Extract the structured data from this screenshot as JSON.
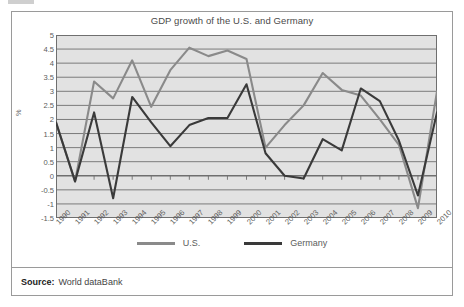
{
  "figure": {
    "title": "GDP growth of the U.S. and Germany",
    "source_label": "Source:",
    "source_value": "World dataBank"
  },
  "legend": {
    "items": [
      {
        "label": "U.S.",
        "color": "#8a8a8a"
      },
      {
        "label": "Germany",
        "color": "#3a3a3a"
      }
    ]
  },
  "colors": {
    "us_line": "#8a8a8a",
    "germany_line": "#3a3a3a",
    "plot_background": "#e2e2e2",
    "gridline": "#6f6f6f",
    "frame": "#9a9a9a",
    "text": "#5c5c5c"
  },
  "chart_data": {
    "type": "line",
    "title": "GDP growth of the U.S. and Germany",
    "xlabel": "",
    "ylabel": "%",
    "ylim": [
      -1.5,
      5
    ],
    "ytick_step": 0.5,
    "yticks": [
      5,
      4.5,
      4,
      3.5,
      3,
      2.5,
      2,
      1.5,
      1,
      0.5,
      0,
      -0.5,
      -1,
      -1.5
    ],
    "ytick_labels": [
      "5",
      "4.5",
      "4",
      "3.5",
      "3",
      "2.5",
      "2",
      "1.5",
      "1",
      "0.5",
      "0",
      "-0.5",
      "-1",
      "-1.5"
    ],
    "grid": true,
    "legend_position": "bottom",
    "categories": [
      "1990",
      "1991",
      "1992",
      "1993",
      "1994",
      "1995",
      "1996",
      "1997",
      "1998",
      "1999",
      "2000",
      "2001",
      "2002",
      "2003",
      "2004",
      "2005",
      "2006",
      "2007",
      "2008",
      "2009",
      "2010"
    ],
    "series": [
      {
        "name": "U.S.",
        "color": "#8a8a8a",
        "values": [
          1.9,
          -0.2,
          3.35,
          2.75,
          4.1,
          2.45,
          3.75,
          4.55,
          4.25,
          4.45,
          4.15,
          1.0,
          1.8,
          2.5,
          3.65,
          3.05,
          2.85,
          2.0,
          1.1,
          -1.15,
          3.0
        ]
      },
      {
        "name": "Germany",
        "color": "#3a3a3a",
        "values": [
          1.9,
          -0.2,
          2.25,
          -0.8,
          2.8,
          1.9,
          1.05,
          1.8,
          2.05,
          2.05,
          3.25,
          0.8,
          0.0,
          -0.1,
          1.3,
          0.9,
          3.1,
          2.65,
          1.25,
          -0.7,
          2.25
        ]
      }
    ]
  }
}
